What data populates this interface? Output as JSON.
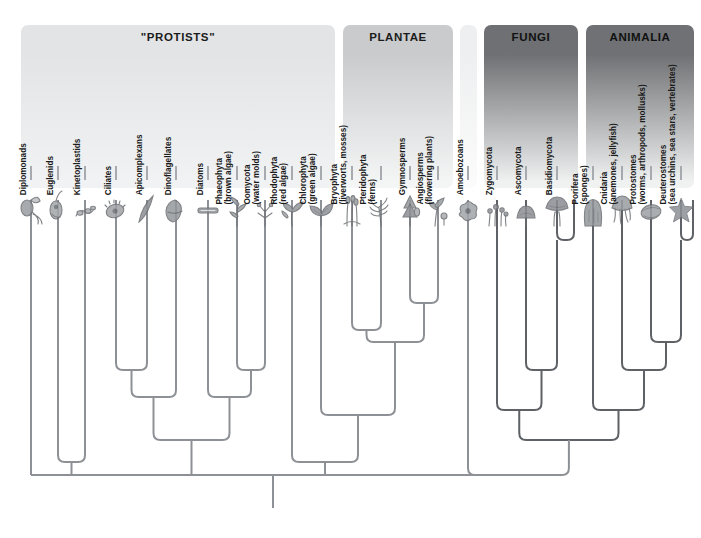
{
  "figure": {
    "background_color": "#ffffff",
    "branch_color": "#8d9196",
    "branch_color_dark": "#5e6165",
    "label_color": "#1a1a1a"
  },
  "panels": [
    {
      "id": "protists",
      "title": "\"PROTISTS\"",
      "x": 21,
      "y": 25,
      "width": 314,
      "height": 163,
      "color_top": "#e3e4e6",
      "color_bottom": "#f1f2f3",
      "shade": "light"
    },
    {
      "id": "plantae",
      "title": "PLANTAE",
      "x": 343,
      "y": 25,
      "width": 110,
      "height": 163,
      "color_top": "#c9cbcd",
      "color_bottom": "#f4f5f5",
      "shade": "light"
    },
    {
      "id": "amoebozoa",
      "title": "",
      "x": 460,
      "y": 25,
      "width": 17,
      "height": 163,
      "color_top": "#eeeff0",
      "color_bottom": "#fbfbfb",
      "shade": "light"
    },
    {
      "id": "fungi",
      "title": "FUNGI",
      "x": 484,
      "y": 25,
      "width": 94,
      "height": 163,
      "color_top": "#6e7073",
      "color_bottom": "#f0f1f1",
      "shade": "dark"
    },
    {
      "id": "animalia",
      "title": "ANIMALIA",
      "x": 586,
      "y": 25,
      "width": 108,
      "height": 163,
      "color_top": "#6f7174",
      "color_bottom": "#f0f1f1",
      "shade": "dark"
    }
  ],
  "taxa": [
    {
      "id": "diplomonads",
      "name": "Diplomonads",
      "sub": "",
      "x": 31,
      "label_baseline": 196,
      "tip_y": 182,
      "glyph": "diplomonad"
    },
    {
      "id": "euglenids",
      "name": "Euglenids",
      "sub": "",
      "x": 58,
      "label_baseline": 196,
      "tip_y": 182,
      "glyph": "euglenid"
    },
    {
      "id": "kinetoplastids",
      "name": "Kinetoplastids",
      "sub": "",
      "x": 85,
      "label_baseline": 196,
      "tip_y": 182,
      "glyph": "kinetoplastid"
    },
    {
      "id": "ciliates",
      "name": "Ciliates",
      "sub": "",
      "x": 116,
      "label_baseline": 196,
      "tip_y": 182,
      "glyph": "ciliate"
    },
    {
      "id": "apicomplexans",
      "name": "Apicomplexans",
      "sub": "",
      "x": 147,
      "label_baseline": 196,
      "tip_y": 182,
      "glyph": "apicomplexan"
    },
    {
      "id": "dinoflagellates",
      "name": "Dinoflagellates",
      "sub": "",
      "x": 176,
      "label_baseline": 196,
      "tip_y": 182,
      "glyph": "dinoflagellate"
    },
    {
      "id": "diatoms",
      "name": "Diatoms",
      "sub": "",
      "x": 208,
      "label_baseline": 196,
      "tip_y": 182,
      "glyph": "diatom"
    },
    {
      "id": "phaeophyta",
      "name": "Phaeophyta",
      "sub": "(brown algae)",
      "x": 237,
      "label_baseline": 196,
      "tip_y": 182,
      "glyph": "brown-alga"
    },
    {
      "id": "oomycota",
      "name": "Oomycota",
      "sub": "(water molds)",
      "x": 265,
      "label_baseline": 196,
      "tip_y": 182,
      "glyph": "water-mold"
    },
    {
      "id": "rhodophyta",
      "name": "Rhodophyta",
      "sub": "(red algae)",
      "x": 292,
      "label_baseline": 196,
      "tip_y": 182,
      "glyph": "red-alga"
    },
    {
      "id": "chlorophyta",
      "name": "Chlorophyta",
      "sub": "(green algae)",
      "x": 321,
      "label_baseline": 196,
      "tip_y": 182,
      "glyph": "green-alga"
    },
    {
      "id": "bryophyta",
      "name": "Bryophyta",
      "sub": "(liverworts, mosses)",
      "x": 352,
      "label_baseline": 196,
      "tip_y": 182,
      "glyph": "moss"
    },
    {
      "id": "pteridophyta",
      "name": "Pteridophyta",
      "sub": "(ferns)",
      "x": 381,
      "label_baseline": 196,
      "tip_y": 182,
      "glyph": "fern"
    },
    {
      "id": "gymnosperms",
      "name": "Gymnosperms",
      "sub": "",
      "x": 410,
      "label_baseline": 196,
      "tip_y": 182,
      "glyph": "conifer"
    },
    {
      "id": "angiosperms",
      "name": "Angiosperms",
      "sub": "(flowering plants)",
      "x": 438,
      "label_baseline": 196,
      "tip_y": 182,
      "glyph": "flower"
    },
    {
      "id": "amoebozoans",
      "name": "Amoebozoans",
      "sub": "",
      "x": 468,
      "label_baseline": 196,
      "tip_y": 182,
      "glyph": "amoeba"
    },
    {
      "id": "zygomycota",
      "name": "Zygomycota",
      "sub": "",
      "x": 497,
      "label_baseline": 196,
      "tip_y": 182,
      "glyph": "zygomycete"
    },
    {
      "id": "ascomycota",
      "name": "Ascomycota",
      "sub": "",
      "x": 526,
      "label_baseline": 196,
      "tip_y": 182,
      "glyph": "ascomycete"
    },
    {
      "id": "basidiomycota",
      "name": "Basidiomycota",
      "sub": "",
      "x": 557,
      "label_baseline": 196,
      "tip_y": 182,
      "glyph": "mushroom"
    },
    {
      "id": "porifera",
      "name": "Porifera",
      "sub": "(sponges)",
      "x": 593,
      "label_baseline": 196,
      "tip_y": 182,
      "glyph": "sponge"
    },
    {
      "id": "cnidaria",
      "name": "Cnidaria",
      "sub": "(anemones, jellyfish)",
      "x": 622,
      "label_baseline": 196,
      "tip_y": 182,
      "glyph": "jellyfish"
    },
    {
      "id": "protostomes",
      "name": "Protostomes",
      "sub": "(worms, arthropods, mollusks)",
      "x": 651,
      "label_baseline": 196,
      "tip_y": 182,
      "glyph": "mollusk"
    },
    {
      "id": "deuterostomes",
      "name": "Deuterostomes",
      "sub": "(sea urchins, sea stars, vertebrates)",
      "x": 681,
      "label_baseline": 196,
      "tip_y": 182,
      "glyph": "sea-star"
    }
  ],
  "tree": {
    "root_x": 273,
    "root_bottom_y": 508,
    "backbone_y": 475,
    "nodes": [
      {
        "id": "n-euglenozoa",
        "children_x": [
          58,
          85
        ],
        "y": 462,
        "label": "Euglenozoa"
      },
      {
        "id": "n-alveolata",
        "children_x": [
          116,
          147
        ],
        "y": 370,
        "label": "Alveolata"
      },
      {
        "id": "n-alveolata2",
        "children_x": [
          131,
          176
        ],
        "y": 397,
        "label": "Alveolata+Dino"
      },
      {
        "id": "n-stramenopile",
        "children_x": [
          237,
          265
        ],
        "y": 370,
        "label": "Stramenopiles"
      },
      {
        "id": "n-strameno2",
        "children_x": [
          208,
          251
        ],
        "y": 397,
        "label": "Diatoms+Stramenopiles"
      },
      {
        "id": "n-chromalv",
        "children_x": [
          153,
          229
        ],
        "y": 440,
        "label": "Chromalveolata"
      },
      {
        "id": "n-archaeplast",
        "children_x": [
          292,
          321
        ],
        "y": 462,
        "label": "Archaeplastida"
      },
      {
        "id": "n-bryo-pterido",
        "children_x": [
          352,
          381
        ],
        "y": 330,
        "label": "Bryophyta+Pteridophyta"
      },
      {
        "id": "n-seedplants",
        "children_x": [
          410,
          438
        ],
        "y": 303,
        "label": "Seed plants"
      },
      {
        "id": "n-vascular",
        "children_x": [
          381,
          424
        ],
        "y": 342,
        "label": "Vascular plants"
      },
      {
        "id": "n-landplants",
        "children_x": [
          352,
          402
        ],
        "y": 358,
        "label": "Land plants"
      },
      {
        "id": "n-viridiplant",
        "children_x": [
          321,
          377
        ],
        "y": 415,
        "label": "Viridiplantae"
      },
      {
        "id": "n-dikarya",
        "children_x": [
          526,
          557
        ],
        "y": 370,
        "label": "Dikarya"
      },
      {
        "id": "n-fungi",
        "children_x": [
          497,
          541
        ],
        "y": 410,
        "label": "Fungi"
      },
      {
        "id": "n-bilateria",
        "children_x": [
          651,
          681
        ],
        "y": 342,
        "label": "Bilateria"
      },
      {
        "id": "n-eumetazoa",
        "children_x": [
          622,
          666
        ],
        "y": 370,
        "label": "Eumetazoa"
      },
      {
        "id": "n-metazoa",
        "children_x": [
          593,
          644
        ],
        "y": 410,
        "label": "Metazoa"
      },
      {
        "id": "n-opisthokont",
        "children_x": [
          519,
          618
        ],
        "y": 440,
        "label": "Opisthokonta"
      },
      {
        "id": "n-unikont",
        "children_x": [
          468,
          568
        ],
        "y": 475,
        "label": "Unikonta"
      }
    ]
  }
}
